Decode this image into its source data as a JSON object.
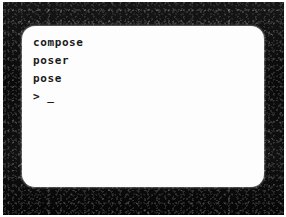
{
  "device": {
    "type": "crt-monitor",
    "bezel_color": "#0d0c0c",
    "screen_color": "#fdfdfd",
    "text_color": "#1a1a1a",
    "photo_border_color": "#ffffff"
  },
  "terminal": {
    "lines": [
      {
        "text": "compose"
      },
      {
        "text": "poser"
      },
      {
        "text": "pose"
      }
    ],
    "prompt": {
      "symbol": ">",
      "input_value": "",
      "cursor": "_"
    }
  }
}
